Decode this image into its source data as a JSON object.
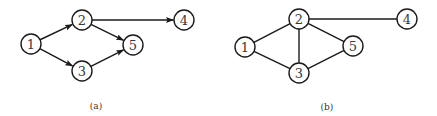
{
  "diagrams": [
    {
      "id": "a",
      "caption": "(a)",
      "directed": true,
      "caption_pos": [
        96,
        106
      ],
      "nodes": [
        {
          "label": "1",
          "x": 31,
          "y": 44
        },
        {
          "label": "2",
          "x": 82,
          "y": 20
        },
        {
          "label": "3",
          "x": 82,
          "y": 71
        },
        {
          "label": "4",
          "x": 184,
          "y": 20
        },
        {
          "label": "5",
          "x": 133,
          "y": 45
        }
      ],
      "edges": [
        {
          "from": "1",
          "to": "2"
        },
        {
          "from": "1",
          "to": "3"
        },
        {
          "from": "2",
          "to": "4"
        },
        {
          "from": "2",
          "to": "5"
        },
        {
          "from": "3",
          "to": "5"
        }
      ]
    },
    {
      "id": "b",
      "caption": "(b)",
      "directed": false,
      "caption_pos": [
        327,
        107
      ],
      "nodes": [
        {
          "label": "1",
          "x": 245,
          "y": 47
        },
        {
          "label": "2",
          "x": 299,
          "y": 19
        },
        {
          "label": "3",
          "x": 299,
          "y": 73
        },
        {
          "label": "4",
          "x": 407,
          "y": 19
        },
        {
          "label": "5",
          "x": 353,
          "y": 46
        }
      ],
      "edges": [
        {
          "from": "1",
          "to": "2"
        },
        {
          "from": "1",
          "to": "3"
        },
        {
          "from": "2",
          "to": "3"
        },
        {
          "from": "2",
          "to": "4"
        },
        {
          "from": "2",
          "to": "5"
        },
        {
          "from": "3",
          "to": "5"
        }
      ]
    }
  ],
  "style": {
    "node_radius": 10,
    "stroke_color": "#1a1a1a",
    "label_color": "#3a3a3a"
  }
}
